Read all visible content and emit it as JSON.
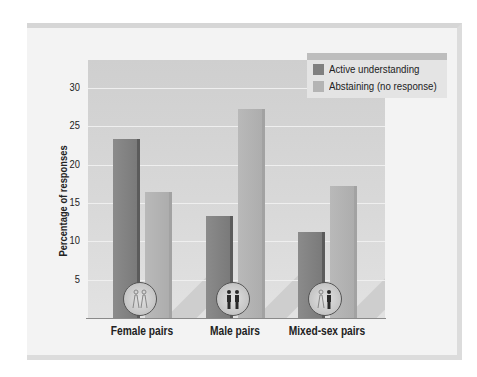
{
  "chart_data": {
    "type": "bar",
    "title": "",
    "xlabel": "",
    "ylabel": "Percentage of responses",
    "ylim": [
      0,
      33
    ],
    "yticks": [
      5,
      10,
      15,
      20,
      25,
      30
    ],
    "grid": true,
    "legend_position": "top-right",
    "categories": [
      "Female pairs",
      "Male pairs",
      "Mixed-sex pairs"
    ],
    "series": [
      {
        "name": "Active understanding",
        "color": "#808080",
        "values": [
          23.3,
          13.3,
          11.2
        ]
      },
      {
        "name": "Abstaining (no response)",
        "color": "#b4b4b4",
        "values": [
          16.4,
          27.2,
          17.2
        ]
      }
    ],
    "category_icons": [
      "two-women-icon",
      "two-men-icon",
      "woman-and-man-icon"
    ]
  },
  "labels": {
    "ylabel": "Percentage of responses",
    "yticks": [
      "5",
      "10",
      "15",
      "20",
      "25",
      "30"
    ],
    "categories": [
      "Female pairs",
      "Male pairs",
      "Mixed-sex pairs"
    ],
    "legend": [
      "Active understanding",
      "Abstaining (no response)"
    ]
  }
}
